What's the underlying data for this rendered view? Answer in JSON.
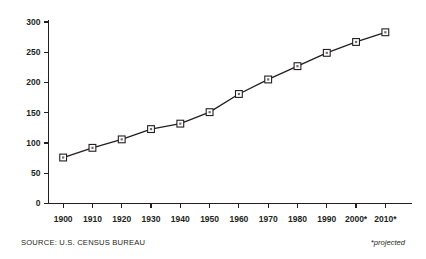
{
  "chart_data": {
    "type": "line",
    "title": "",
    "subtitle": "",
    "xlabel": "",
    "ylabel": "",
    "categories": [
      "1900",
      "1910",
      "1920",
      "1930",
      "1940",
      "1950",
      "1960",
      "1970",
      "1980",
      "1990",
      "2000*",
      "2010*"
    ],
    "x": [
      1900,
      1910,
      1920,
      1930,
      1940,
      1950,
      1960,
      1970,
      1980,
      1990,
      2000,
      2010
    ],
    "values": [
      76,
      92,
      106,
      123,
      132,
      151,
      181,
      205,
      227,
      249,
      267,
      283
    ],
    "series": [
      {
        "name": "U.S. Population (millions)",
        "values": [
          76,
          92,
          106,
          123,
          132,
          151,
          181,
          205,
          227,
          249,
          267,
          283
        ]
      }
    ],
    "ylim": [
      0,
      300
    ],
    "yticks": [
      0,
      50,
      100,
      150,
      200,
      250,
      300
    ],
    "ytick_labels": [
      "0",
      "50",
      "100",
      "150",
      "200",
      "250",
      "300"
    ],
    "xlim": [
      1895,
      2015
    ],
    "grid": false,
    "legend": false,
    "legend_position": "none",
    "line_color": "#231f20",
    "marker_fill": "#ffffff",
    "marker_edge": "#231f20",
    "axis_color": "#231f20",
    "background": "#ffffff",
    "annotations": [
      "*projected"
    ]
  },
  "footer": {
    "source": "SOURCE: U.S. CENSUS BUREAU",
    "projected_note": "*projected"
  }
}
